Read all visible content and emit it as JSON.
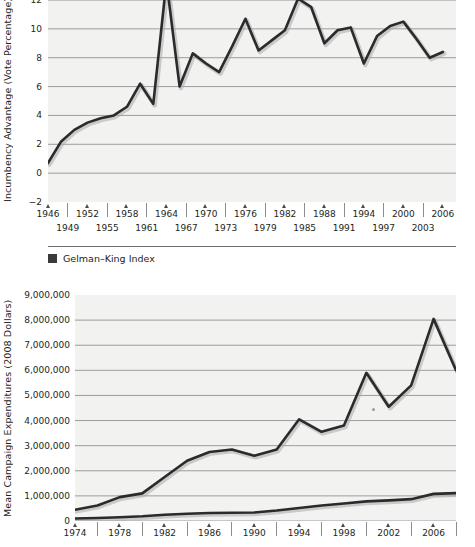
{
  "chart_data": [
    {
      "id": "incumbency-advantage",
      "type": "line",
      "title": "",
      "xlabel": "",
      "ylabel": "Incumbency Advantage (Vote Percentage)",
      "ylim": [
        -2,
        12
      ],
      "yticks": [
        12,
        10,
        8,
        6,
        4,
        2,
        0,
        -2
      ],
      "ytick_labels": [
        "12",
        "10",
        "8",
        "6",
        "4",
        "2",
        "0",
        "-2"
      ],
      "xlim": [
        1946,
        2008
      ],
      "xticks": [
        1946,
        1949,
        1952,
        1955,
        1958,
        1961,
        1964,
        1967,
        1970,
        1973,
        1976,
        1979,
        1982,
        1985,
        1988,
        1991,
        1994,
        1997,
        2000,
        2003,
        2006
      ],
      "xtick_labels_top": [
        "1946",
        "1952",
        "1958",
        "1964",
        "1970",
        "1976",
        "1982",
        "1988",
        "1994",
        "2000",
        "2006"
      ],
      "xtick_labels_bottom": [
        "1949",
        "1955",
        "1961",
        "1967",
        "1973",
        "1979",
        "1985",
        "1991",
        "1997",
        "2003"
      ],
      "grid": true,
      "legend": [
        {
          "label": "Gelman–King Index",
          "color": "#3a3a3a"
        }
      ],
      "series": [
        {
          "name": "Gelman–King Index",
          "color": "#2b2b2b",
          "x": [
            1946,
            1948,
            1950,
            1952,
            1954,
            1956,
            1958,
            1960,
            1962,
            1964,
            1966,
            1968,
            1970,
            1972,
            1974,
            1976,
            1978,
            1980,
            1982,
            1984,
            1986,
            1988,
            1990,
            1992,
            1994,
            1996,
            1998,
            2000,
            2002,
            2004,
            2006
          ],
          "values": [
            0.7,
            2.2,
            3.0,
            3.5,
            3.8,
            4.0,
            4.6,
            6.2,
            4.8,
            13.3,
            6.0,
            8.3,
            7.6,
            7.0,
            8.8,
            10.7,
            8.5,
            9.2,
            9.9,
            12.1,
            11.5,
            9.0,
            9.9,
            10.1,
            7.6,
            9.5,
            10.2,
            10.5,
            9.3,
            8.0,
            8.4
          ],
          "note_last_value": 7.6
        }
      ]
    },
    {
      "id": "mean-campaign-expenditures",
      "type": "line",
      "title": "",
      "xlabel": "",
      "ylabel": "Mean Campaign Expenditures (2008 Dollars)",
      "ylim": [
        0,
        9000000
      ],
      "yticks": [
        9000000,
        8000000,
        7000000,
        6000000,
        5000000,
        4000000,
        3000000,
        2000000,
        1000000,
        0
      ],
      "ytick_labels": [
        "9,000,000",
        "8,000,000",
        "7,000,000",
        "6,000,000",
        "5,000,000",
        "4,000,000",
        "3,000,000",
        "2,000,000",
        "1,000,000",
        "0"
      ],
      "xlim": [
        1974,
        2008
      ],
      "xtick_labels": [
        "1974",
        "1978",
        "1982",
        "1986",
        "1990",
        "1994",
        "1998",
        "2002",
        "2006"
      ],
      "grid": true,
      "series": [
        {
          "name": "upper",
          "color": "#2b2b2b",
          "x": [
            1974,
            1976,
            1978,
            1980,
            1982,
            1984,
            1986,
            1988,
            1990,
            1992,
            1994,
            1996,
            1998,
            2000,
            2002,
            2004,
            2006,
            2008
          ],
          "values": [
            450000,
            620000,
            950000,
            1100000,
            1750000,
            2400000,
            2750000,
            2850000,
            2600000,
            2850000,
            4050000,
            3550000,
            3800000,
            5900000,
            4550000,
            5400000,
            8050000,
            6000000
          ]
        },
        {
          "name": "lower",
          "color": "#2b2b2b",
          "x": [
            1974,
            1976,
            1978,
            1980,
            1982,
            1984,
            1986,
            1988,
            1990,
            1992,
            1994,
            1996,
            1998,
            2000,
            2002,
            2004,
            2006,
            2008
          ],
          "values": [
            100000,
            120000,
            150000,
            190000,
            250000,
            290000,
            320000,
            330000,
            340000,
            420000,
            520000,
            620000,
            700000,
            780000,
            820000,
            870000,
            1080000,
            1110000
          ]
        }
      ]
    }
  ],
  "chart1": {
    "ylabel": "Incumbency Advantage (Vote Percentage)",
    "yticks": [
      "12",
      "10",
      "8",
      "6",
      "4",
      "2",
      "0",
      "-2"
    ],
    "xticks_top": [
      "1946",
      "1952",
      "1958",
      "1964",
      "1970",
      "1976",
      "1982",
      "1988",
      "1994",
      "2000",
      "2006"
    ],
    "xticks_bottom": [
      "1949",
      "1955",
      "1961",
      "1967",
      "1973",
      "1979",
      "1985",
      "1991",
      "1997",
      "2003"
    ],
    "legend_label": "Gelman–King Index",
    "legend_color": "#3a3a3a"
  },
  "chart2": {
    "ylabel": "Mean Campaign Expenditures (2008 Dollars)",
    "yticks": [
      "9,000,000",
      "8,000,000",
      "7,000,000",
      "6,000,000",
      "5,000,000",
      "4,000,000",
      "3,000,000",
      "2,000,000",
      "1,000,000",
      "0"
    ],
    "xticks": [
      "1974",
      "1978",
      "1982",
      "1986",
      "1990",
      "1994",
      "1998",
      "2002",
      "2006"
    ]
  }
}
